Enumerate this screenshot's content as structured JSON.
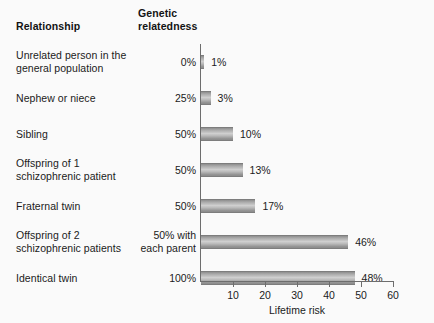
{
  "headers": {
    "relationship": "Relationship",
    "relatedness": "Genetic\nrelatedness"
  },
  "chart_data": {
    "type": "bar",
    "orientation": "horizontal",
    "title": "",
    "xlabel": "Lifetime risk",
    "ylabel": "",
    "xlim": [
      0,
      60
    ],
    "xticks": [
      10,
      20,
      30,
      40,
      50,
      60
    ],
    "grid": false,
    "legend": null,
    "bar_color": "#b4b4b4",
    "categories": [
      "Unrelated person in the general population",
      "Nephew or niece",
      "Sibling",
      "Offspring of 1 schizophrenic patient",
      "Fraternal twin",
      "Offspring of 2 schizophrenic patients",
      "Identical twin"
    ],
    "values": [
      1,
      3,
      10,
      13,
      17,
      46,
      48
    ],
    "value_labels": [
      "1%",
      "3%",
      "10%",
      "13%",
      "17%",
      "46%",
      "48%"
    ],
    "relatedness": [
      "0%",
      "25%",
      "50%",
      "50%",
      "50%",
      "50% with each parent",
      "100%"
    ]
  },
  "rows": [
    {
      "label_line1": "Unrelated person in the",
      "label_line2": "general population",
      "relatedness_line1": "0%",
      "relatedness_line2": "",
      "value": 1,
      "value_label": "1%"
    },
    {
      "label_line1": "Nephew or niece",
      "label_line2": "",
      "relatedness_line1": "25%",
      "relatedness_line2": "",
      "value": 3,
      "value_label": "3%"
    },
    {
      "label_line1": "Sibling",
      "label_line2": "",
      "relatedness_line1": "50%",
      "relatedness_line2": "",
      "value": 10,
      "value_label": "10%"
    },
    {
      "label_line1": "Offspring of 1",
      "label_line2": "schizophrenic patient",
      "relatedness_line1": "50%",
      "relatedness_line2": "",
      "value": 13,
      "value_label": "13%"
    },
    {
      "label_line1": "Fraternal twin",
      "label_line2": "",
      "relatedness_line1": "50%",
      "relatedness_line2": "",
      "value": 17,
      "value_label": "17%"
    },
    {
      "label_line1": "Offspring of 2",
      "label_line2": "schizophrenic patients",
      "relatedness_line1": "50% with",
      "relatedness_line2": "each parent",
      "value": 46,
      "value_label": "46%"
    },
    {
      "label_line1": "Identical twin",
      "label_line2": "",
      "relatedness_line1": "100%",
      "relatedness_line2": "",
      "value": 48,
      "value_label": "48%"
    }
  ],
  "axis": {
    "xlabel": "Lifetime risk",
    "ticks": [
      "10",
      "20",
      "30",
      "40",
      "50",
      "60"
    ]
  }
}
